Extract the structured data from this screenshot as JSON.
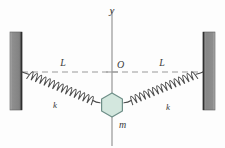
{
  "figure": {
    "type": "physics-diagram"
  },
  "labels": {
    "y_axis": "y",
    "origin": "O",
    "length_left": "L",
    "length_right": "L",
    "spring_const_left": "k",
    "spring_const_right": "k",
    "mass": "m"
  },
  "colors": {
    "wall_fill": "#8a8a8a",
    "wall_edge": "#3c3c3c",
    "spring_stroke": "#4a4a4a",
    "axis_stroke": "#8d8d8d",
    "dash_stroke": "#9a9a9a",
    "mass_fill": "#d3e7de",
    "mass_stroke": "#6e8f88",
    "label_color": "#3a3a3a",
    "background": "#fdfdfd"
  },
  "geometry": {
    "left_wall": {
      "x": 10,
      "y": 32,
      "width": 12,
      "height": 78
    },
    "right_wall": {
      "x": 203,
      "y": 32,
      "width": 12,
      "height": 78
    },
    "left_anchor": {
      "x": 22,
      "y": 72
    },
    "right_anchor": {
      "x": 203,
      "y": 72
    },
    "origin": {
      "x": 112,
      "y": 72
    },
    "mass_center": {
      "x": 112,
      "y": 105
    },
    "mass_radius": 12,
    "y_axis_top": {
      "x": 112,
      "y": 10
    },
    "y_axis_bottom": {
      "x": 112,
      "y": 146
    },
    "spring_coils": 15
  }
}
